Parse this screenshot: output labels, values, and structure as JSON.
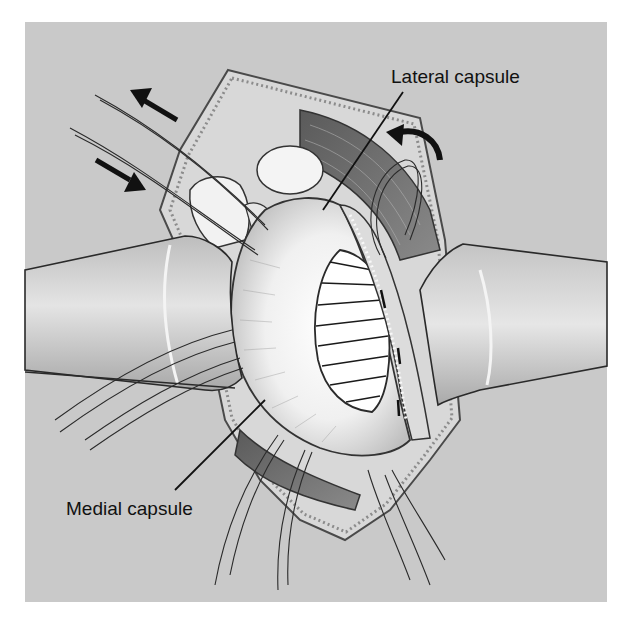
{
  "figure": {
    "type": "surgical-illustration",
    "background_color": "#c9c9c9",
    "labels": [
      {
        "id": "lateral",
        "text": "Lateral capsule",
        "anchor": [
          403,
          92
        ],
        "target": [
          323,
          210
        ]
      },
      {
        "id": "medial",
        "text": "Medial capsule",
        "anchor": [
          265,
          400
        ],
        "target": [
          175,
          490
        ]
      }
    ],
    "arrows": [
      {
        "id": "arrow-out",
        "direction": "up-left"
      },
      {
        "id": "arrow-in",
        "direction": "down-right"
      },
      {
        "id": "arrow-curved",
        "direction": "counterclockwise"
      }
    ]
  }
}
